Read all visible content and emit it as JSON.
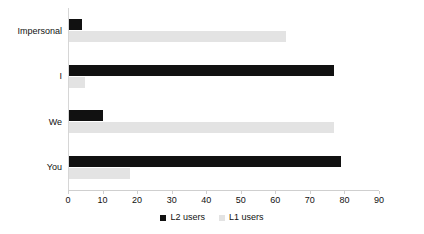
{
  "chart_data": {
    "type": "bar",
    "orientation": "horizontal",
    "title": "",
    "subtitle": "",
    "xlabel": "",
    "ylabel": "",
    "categories": [
      "Impersonal",
      "I",
      "We",
      "You"
    ],
    "series": [
      {
        "name": "L2 users",
        "color": "#111111",
        "values": [
          4,
          77,
          10,
          79
        ]
      },
      {
        "name": "L1 users",
        "color": "#e3e3e3",
        "values": [
          63,
          5,
          77,
          18
        ]
      }
    ],
    "xlim": [
      0,
      90
    ],
    "xticks": [
      0,
      10,
      20,
      30,
      40,
      50,
      60,
      70,
      80,
      90
    ],
    "xtick_labels": [
      "0",
      "10",
      "20",
      "30",
      "40",
      "50",
      "60",
      "70",
      "80",
      "90"
    ],
    "grid": false,
    "legend_position": "bottom",
    "legend_entries": [
      "L2 users",
      "L1 users"
    ]
  },
  "axis": {
    "x_tick_labels": [
      "0",
      "10",
      "20",
      "30",
      "40",
      "50",
      "60",
      "70",
      "80",
      "90"
    ],
    "category_labels": [
      "Impersonal",
      "I",
      "We",
      "You"
    ]
  },
  "legend": {
    "items": [
      {
        "label": "L2 users",
        "swatch": "black-square-swatch"
      },
      {
        "label": "L1 users",
        "swatch": "light-gray-square-swatch"
      }
    ]
  }
}
